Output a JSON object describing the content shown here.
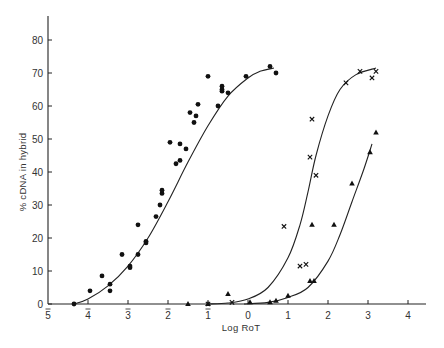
{
  "chart_data": {
    "type": "scatter",
    "title": "",
    "xlabel": "Log RoT",
    "ylabel": "% cDNA in hybrid",
    "xlim": [
      -5,
      4.5
    ],
    "ylim": [
      0,
      88
    ],
    "grid": false,
    "legend": "none",
    "x_ticks": [
      {
        "value": -5,
        "label": "5",
        "bar": true
      },
      {
        "value": -4,
        "label": "4",
        "bar": true
      },
      {
        "value": -3,
        "label": "3",
        "bar": true
      },
      {
        "value": -2,
        "label": "2",
        "bar": true
      },
      {
        "value": -1,
        "label": "1",
        "bar": true
      },
      {
        "value": 0,
        "label": "0",
        "bar": false
      },
      {
        "value": 1,
        "label": "1",
        "bar": false
      },
      {
        "value": 2,
        "label": "2",
        "bar": false
      },
      {
        "value": 3,
        "label": "3",
        "bar": false
      },
      {
        "value": 4,
        "label": "4",
        "bar": false
      }
    ],
    "y_ticks": [
      0,
      10,
      20,
      30,
      40,
      50,
      60,
      70,
      80
    ],
    "series": [
      {
        "name": "dots",
        "marker": "circle",
        "points": [
          [
            -4.35,
            0
          ],
          [
            -3.95,
            4
          ],
          [
            -3.65,
            8.5
          ],
          [
            -3.45,
            6
          ],
          [
            -3.45,
            4
          ],
          [
            -3.15,
            15
          ],
          [
            -2.95,
            11
          ],
          [
            -2.95,
            11.5
          ],
          [
            -2.75,
            15
          ],
          [
            -2.75,
            24
          ],
          [
            -2.55,
            19
          ],
          [
            -2.55,
            18.5
          ],
          [
            -2.3,
            26.5
          ],
          [
            -2.2,
            30
          ],
          [
            -2.15,
            33.5
          ],
          [
            -2.15,
            34.5
          ],
          [
            -1.95,
            49
          ],
          [
            -1.8,
            42.5
          ],
          [
            -1.7,
            43.5
          ],
          [
            -1.7,
            48.5
          ],
          [
            -1.55,
            47
          ],
          [
            -1.45,
            58
          ],
          [
            -1.35,
            55
          ],
          [
            -1.3,
            57
          ],
          [
            -1.25,
            60.5
          ],
          [
            -1.0,
            69
          ],
          [
            -0.75,
            60
          ],
          [
            -0.65,
            66
          ],
          [
            -0.65,
            64.5
          ],
          [
            -0.65,
            65
          ],
          [
            -0.5,
            64
          ],
          [
            -0.05,
            69
          ],
          [
            0.55,
            72
          ],
          [
            0.7,
            70
          ]
        ],
        "curve": [
          [
            -4.35,
            0
          ],
          [
            -4.0,
            1.5
          ],
          [
            -3.5,
            5.5
          ],
          [
            -3.0,
            11.5
          ],
          [
            -2.5,
            20
          ],
          [
            -2.0,
            31
          ],
          [
            -1.5,
            43
          ],
          [
            -1.0,
            54
          ],
          [
            -0.5,
            63
          ],
          [
            0.0,
            68.5
          ],
          [
            0.3,
            70.5
          ],
          [
            0.65,
            71.5
          ]
        ]
      },
      {
        "name": "crosses",
        "marker": "x",
        "points": [
          [
            -1.0,
            0
          ],
          [
            -0.4,
            0.5
          ],
          [
            0.9,
            23.5
          ],
          [
            1.3,
            11.5
          ],
          [
            1.45,
            12
          ],
          [
            1.55,
            44.5
          ],
          [
            1.6,
            56
          ],
          [
            1.7,
            39
          ],
          [
            2.45,
            67
          ],
          [
            2.8,
            70.5
          ],
          [
            3.1,
            68.5
          ],
          [
            3.2,
            70.5
          ]
        ],
        "curve": [
          [
            -1.0,
            0
          ],
          [
            -0.5,
            0.3
          ],
          [
            0.0,
            1.5
          ],
          [
            0.5,
            5
          ],
          [
            1.0,
            14
          ],
          [
            1.3,
            24
          ],
          [
            1.5,
            34
          ],
          [
            1.7,
            45
          ],
          [
            2.0,
            57
          ],
          [
            2.3,
            65
          ],
          [
            2.7,
            69.5
          ],
          [
            3.2,
            71.5
          ]
        ]
      },
      {
        "name": "triangles",
        "marker": "triangle",
        "points": [
          [
            -1.5,
            0
          ],
          [
            -1.0,
            0
          ],
          [
            -0.5,
            3
          ],
          [
            0.05,
            0.5
          ],
          [
            0.55,
            0.5
          ],
          [
            0.7,
            1
          ],
          [
            1.0,
            2.5
          ],
          [
            1.55,
            7
          ],
          [
            1.65,
            7
          ],
          [
            1.6,
            24
          ],
          [
            2.15,
            24
          ],
          [
            2.6,
            36.5
          ],
          [
            3.05,
            46
          ],
          [
            3.2,
            52
          ]
        ],
        "curve": [
          [
            -0.1,
            0
          ],
          [
            0.5,
            0.5
          ],
          [
            1.0,
            2
          ],
          [
            1.5,
            5
          ],
          [
            2.0,
            13
          ],
          [
            2.3,
            21
          ],
          [
            2.6,
            31
          ],
          [
            2.9,
            41
          ],
          [
            3.1,
            48.5
          ]
        ]
      }
    ]
  },
  "axes": {
    "xlabel": "Log RoT",
    "ylabel": "% cDNA in hybrid"
  }
}
